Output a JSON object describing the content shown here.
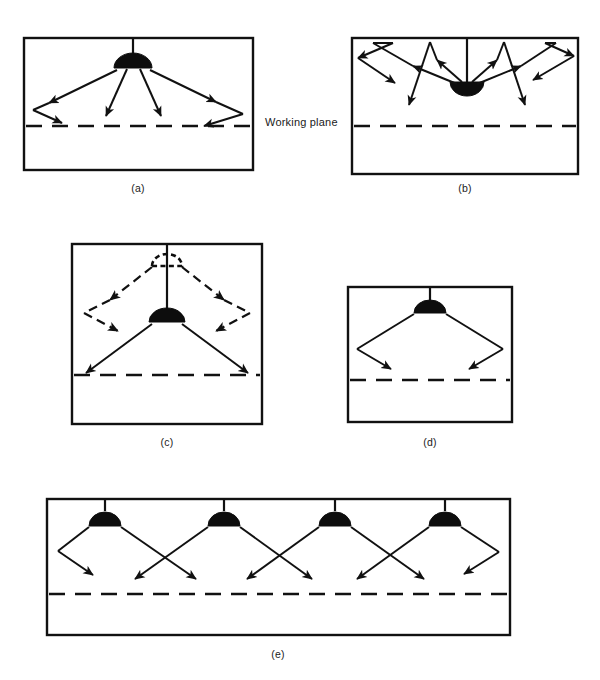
{
  "figure": {
    "background_color": "#ffffff",
    "line_color": "#111111",
    "luminaire_color": "#0d0d0d",
    "width": 600,
    "height": 680
  },
  "labels": {
    "working_plane": "Working plane"
  },
  "panels": [
    {
      "id": "a",
      "caption": "(a)",
      "description": "Direct luminaire: downward light plus wall-reflected light reaching the working plane",
      "luminaire_type": "direct-dome",
      "luminaire_count": 1,
      "has_working_plane": true,
      "working_plane_label": "Working plane",
      "ray_style": "solid"
    },
    {
      "id": "b",
      "caption": "(b)",
      "description": "Indirect uplight luminaire: light directed to the ceiling then reflected down",
      "luminaire_type": "indirect-uplight",
      "luminaire_count": 1,
      "has_working_plane": true,
      "working_plane_label": "",
      "ray_style": "solid"
    },
    {
      "id": "c",
      "caption": "(c)",
      "description": "Effect of mounting height: ghosted ceiling position with dashed rays versus lowered luminaire with solid rays",
      "luminaire_type": "direct-dome-with-ghost",
      "luminaire_count": 2,
      "has_working_plane": true,
      "working_plane_label": "",
      "ray_style": "dashed-and-solid"
    },
    {
      "id": "d",
      "caption": "(d)",
      "description": "Single luminaire in a room: beams strike side walls and reflect to the working plane",
      "luminaire_type": "direct-dome",
      "luminaire_count": 1,
      "has_working_plane": true,
      "working_plane_label": "",
      "ray_style": "solid"
    },
    {
      "id": "e",
      "caption": "(e)",
      "description": "Row of four luminaires with overlapping crossing beams giving uniform illuminance on the working plane",
      "luminaire_type": "direct-dome",
      "luminaire_count": 4,
      "has_working_plane": true,
      "working_plane_label": "",
      "ray_style": "solid"
    }
  ]
}
